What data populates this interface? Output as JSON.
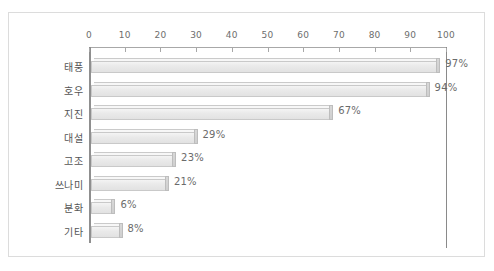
{
  "chart_data": {
    "type": "bar",
    "orientation": "horizontal",
    "title": "",
    "subtitle": "",
    "xlabel": "",
    "ylabel": "",
    "xlim": [
      0,
      100
    ],
    "xticks": [
      0,
      10,
      20,
      30,
      40,
      50,
      60,
      70,
      80,
      90,
      100
    ],
    "xtick_labels": [
      "0",
      "10",
      "20",
      "30",
      "40",
      "50",
      "60",
      "70",
      "80",
      "90",
      "100"
    ],
    "grid": false,
    "legend": null,
    "axis_position": "top",
    "value_suffix": "%",
    "categories": [
      "태풍",
      "호우",
      "지진",
      "대설",
      "고조",
      "쓰나미",
      "분화",
      "기타"
    ],
    "values": [
      97,
      94,
      67,
      29,
      23,
      21,
      6,
      8
    ],
    "data_labels": [
      "97%",
      "94%",
      "67%",
      "29%",
      "23%",
      "21%",
      "6%",
      "8%"
    ],
    "bars": [
      {
        "category": "태풍",
        "value": 97,
        "label": "97%"
      },
      {
        "category": "호우",
        "value": 94,
        "label": "94%"
      },
      {
        "category": "지진",
        "value": 67,
        "label": "67%"
      },
      {
        "category": "대설",
        "value": 29,
        "label": "29%"
      },
      {
        "category": "고조",
        "value": 23,
        "label": "23%"
      },
      {
        "category": "쓰나미",
        "value": 21,
        "label": "21%"
      },
      {
        "category": "분화",
        "value": 6,
        "label": "6%"
      },
      {
        "category": "기타",
        "value": 8,
        "label": "8%"
      }
    ],
    "colors": {
      "bar_face": "#eaeaea",
      "bar_edge": "#c9c9c9",
      "bar_cap": "#d4d4d4",
      "axis": "#8f8f8f",
      "tick_label": "#6e6e6e",
      "category_label": "#555555",
      "value_label": "#6b6b6b",
      "frame": "#dcdcdc",
      "background": "#ffffff"
    }
  }
}
